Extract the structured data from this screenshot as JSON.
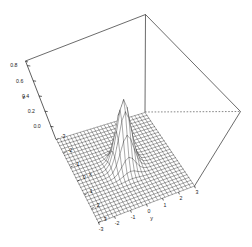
{
  "figure": {
    "background_color": "#ffffff",
    "line_color": "#1a1a1a",
    "width": 252,
    "height": 247,
    "renderer": "persp-wireframe"
  },
  "chart_data": {
    "type": "surface",
    "title": "",
    "subtitle": "",
    "xlabel": "x",
    "ylabel": "y",
    "zlabel": "z",
    "grid": false,
    "legend": "none",
    "projection": "perspective",
    "surface_style": "wireframe-mesh",
    "surface_color": "#ffffff",
    "mesh_color": "#1f1f1f",
    "bounding_box": "drawn",
    "hidden_edge_style": "dotted",
    "xlim": [
      -3,
      3
    ],
    "ylim": [
      -3,
      3
    ],
    "zlim": [
      0,
      0.9
    ],
    "x_ticks": [
      -3,
      -2,
      -1,
      0,
      1,
      2,
      3
    ],
    "x_tick_labels": [
      "-3",
      "-2",
      "-1",
      "0",
      "1",
      "2",
      "3"
    ],
    "y_ticks": [
      -3,
      -2,
      -1,
      0,
      1,
      2,
      3
    ],
    "y_tick_labels": [
      "-3",
      "-2",
      "-1",
      "0",
      "1",
      "2",
      "3"
    ],
    "z_ticks": [
      0.0,
      0.2,
      0.4,
      0.6,
      0.8
    ],
    "z_tick_labels": [
      "0.0",
      "0.2",
      "0.4",
      "0.6",
      "0.8"
    ],
    "grid_divisions_x": 26,
    "grid_divisions_y": 26,
    "function": "bivariate gaussian bump centred at (0,0)",
    "peak_value": 0.85,
    "peak_location": [
      0,
      0
    ],
    "sigma": 0.42
  },
  "axis_labels": {
    "z_axis_title": "z",
    "x_axis_title": "x",
    "y_axis_title": "y"
  },
  "z_axis": {
    "labels": [
      "0.8",
      "0.6",
      "0.4",
      "0.2",
      "0.0"
    ],
    "title": "z"
  },
  "x_axis": {
    "labels": [
      "-3",
      "-2",
      "-1",
      "0",
      "1",
      "2",
      "3"
    ],
    "title": "x"
  },
  "y_axis": {
    "labels": [
      "-3",
      "-2",
      "-1",
      "0",
      "1",
      "2",
      "3"
    ],
    "title": "y"
  }
}
